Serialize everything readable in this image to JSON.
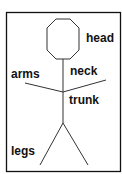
{
  "diagram": {
    "labels": {
      "head": "head",
      "neck": "neck",
      "arms": "arms",
      "trunk": "trunk",
      "legs": "legs"
    },
    "colors": {
      "stroke": "#222222",
      "border": "#111111",
      "background": "#ffffff"
    }
  }
}
